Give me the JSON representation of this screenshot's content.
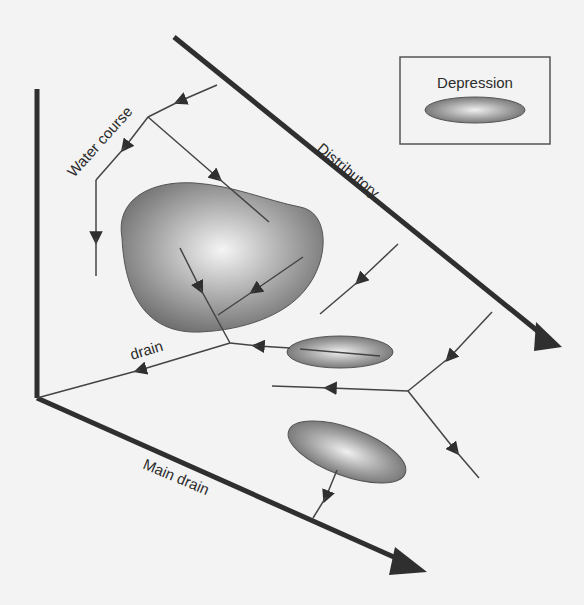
{
  "labels": {
    "water_course": "Water course",
    "distributory": "Distributory",
    "drain": "drain",
    "main_drain": "Main drain"
  },
  "legend": {
    "title": "Depression"
  },
  "colors": {
    "background": "#f3f3f3",
    "line": "#2f2f2f",
    "depression_dark": "#6e6e6e",
    "depression_light": "#f2f2f2"
  }
}
